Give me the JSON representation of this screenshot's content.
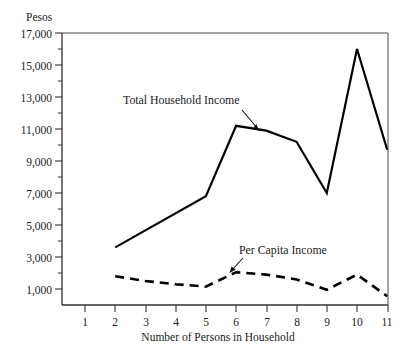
{
  "chart_data": {
    "type": "line",
    "title": "",
    "subtitle": "",
    "ylabel": "Pesos",
    "xlabel": "Number of Persons in Household",
    "x": [
      1,
      2,
      3,
      4,
      5,
      6,
      7,
      8,
      9,
      10,
      11
    ],
    "xtick_labels": [
      "1",
      "2",
      "3",
      "4",
      "5",
      "6",
      "7",
      "8",
      "9",
      "10",
      "11"
    ],
    "ytick_labels": [
      "1,000",
      "3,000",
      "5,000",
      "7,000",
      "9,000",
      "11,000",
      "13,000",
      "15,000",
      "17,000"
    ],
    "ytick_values": [
      1000,
      3000,
      5000,
      7000,
      9000,
      11000,
      13000,
      15000,
      17000
    ],
    "ylim": [
      0,
      17600
    ],
    "xlim": [
      0.5,
      11.2
    ],
    "grid": false,
    "legend_position": "inline-annotations",
    "minor_yticks": [
      2000,
      4000,
      6000,
      8000,
      10000,
      12000,
      14000,
      16000
    ],
    "series": [
      {
        "name": "Total Household Income",
        "style": "solid",
        "color": "#000000",
        "x": [
          2,
          5,
          6,
          7,
          8,
          9,
          10,
          11
        ],
        "values": [
          3600,
          6800,
          11200,
          10900,
          10200,
          7000,
          16000,
          9700
        ]
      },
      {
        "name": "Per Capita Income",
        "style": "dashed",
        "color": "#000000",
        "x": [
          2,
          3,
          4,
          5,
          6,
          7,
          8,
          9,
          10,
          11
        ],
        "values": [
          1800,
          1500,
          1300,
          1150,
          2050,
          1900,
          1600,
          950,
          1900,
          550
        ]
      }
    ],
    "annotations": [
      {
        "text": "Total Household Income",
        "label_x": 123,
        "label_y": 104,
        "arrow_from_x": 242,
        "arrow_from_y": 110,
        "arrow_to_x": 259,
        "arrow_to_y": 130
      },
      {
        "text": "Per Capita Income",
        "label_x": 239,
        "label_y": 254,
        "arrow_from_x": 243,
        "arrow_from_y": 258,
        "arrow_to_x": 230,
        "arrow_to_y": 273
      }
    ]
  },
  "figure": {
    "axis_color": "#333333",
    "plot_left": 62,
    "plot_right": 388,
    "plot_top": 33,
    "plot_bottom": 305
  }
}
